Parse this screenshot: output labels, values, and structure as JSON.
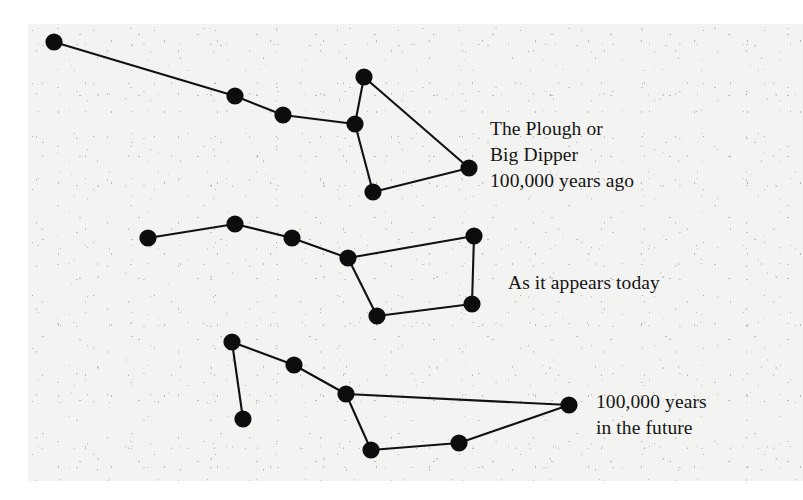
{
  "figure": {
    "background_color": "#f4f4f2",
    "ink_color": "#0d0d0d",
    "width": 803,
    "height": 500
  },
  "captions": {
    "past": "The Plough or\nBig Dipper\n100,000 years ago",
    "present": "As it appears today",
    "future": "100,000 years\nin the future"
  },
  "chart_data": {
    "type": "scatter",
    "xlabel": "",
    "ylabel": "",
    "grid": false,
    "legend_position": "right",
    "axis_units": "pixels (image coordinates)",
    "xlim": [
      28,
      803
    ],
    "ylim": [
      24,
      481
    ],
    "series": [
      {
        "name": "The Plough or Big Dipper 100,000 years ago",
        "label_position": [
          490,
          116
        ],
        "points": [
          {
            "id": "h1",
            "x": 54,
            "y": 42
          },
          {
            "id": "h2",
            "x": 235,
            "y": 96
          },
          {
            "id": "h3",
            "x": 283,
            "y": 115
          },
          {
            "id": "b1",
            "x": 355,
            "y": 124
          },
          {
            "id": "b2",
            "x": 364,
            "y": 77
          },
          {
            "id": "b3",
            "x": 469,
            "y": 168
          },
          {
            "id": "b4",
            "x": 373,
            "y": 192
          }
        ],
        "edges": [
          [
            "h1",
            "h2"
          ],
          [
            "h2",
            "h3"
          ],
          [
            "h3",
            "b1"
          ],
          [
            "b1",
            "b2"
          ],
          [
            "b2",
            "b3"
          ],
          [
            "b3",
            "b4"
          ],
          [
            "b4",
            "b1"
          ]
        ]
      },
      {
        "name": "As it appears today",
        "label_position": [
          508,
          270
        ],
        "points": [
          {
            "id": "h1",
            "x": 148,
            "y": 238
          },
          {
            "id": "h2",
            "x": 235,
            "y": 224
          },
          {
            "id": "h3",
            "x": 292,
            "y": 238
          },
          {
            "id": "b1",
            "x": 348,
            "y": 258
          },
          {
            "id": "b2",
            "x": 474,
            "y": 236
          },
          {
            "id": "b3",
            "x": 472,
            "y": 304
          },
          {
            "id": "b4",
            "x": 377,
            "y": 316
          }
        ],
        "edges": [
          [
            "h1",
            "h2"
          ],
          [
            "h2",
            "h3"
          ],
          [
            "h3",
            "b1"
          ],
          [
            "b1",
            "b2"
          ],
          [
            "b2",
            "b3"
          ],
          [
            "b3",
            "b4"
          ],
          [
            "b4",
            "b1"
          ]
        ]
      },
      {
        "name": "100,000 years in the future",
        "label_position": [
          596,
          389
        ],
        "points": [
          {
            "id": "h1",
            "x": 232,
            "y": 342
          },
          {
            "id": "h0",
            "x": 243,
            "y": 419
          },
          {
            "id": "h2",
            "x": 294,
            "y": 365
          },
          {
            "id": "b1",
            "x": 346,
            "y": 394
          },
          {
            "id": "b2",
            "x": 569,
            "y": 405
          },
          {
            "id": "b3",
            "x": 459,
            "y": 443
          },
          {
            "id": "b4",
            "x": 371,
            "y": 450
          }
        ],
        "edges": [
          [
            "h1",
            "h0"
          ],
          [
            "h1",
            "h2"
          ],
          [
            "h2",
            "b1"
          ],
          [
            "b1",
            "b2"
          ],
          [
            "b2",
            "b3"
          ],
          [
            "b3",
            "b4"
          ],
          [
            "b4",
            "b1"
          ]
        ]
      }
    ],
    "star_radius": 8.6
  }
}
